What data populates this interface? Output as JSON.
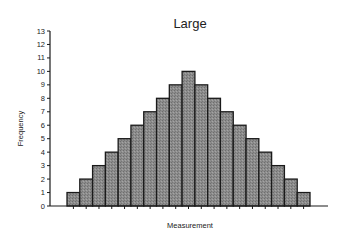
{
  "chart_data": {
    "type": "bar",
    "title": "Large",
    "xlabel": "Measurement",
    "ylabel": "Frequency",
    "ylim": [
      0,
      13
    ],
    "yticks": [
      0,
      1,
      2,
      3,
      4,
      5,
      6,
      7,
      8,
      9,
      10,
      11,
      12,
      13
    ],
    "categories": [
      "1",
      "2",
      "3",
      "4",
      "5",
      "6",
      "7",
      "8",
      "9",
      "10",
      "11",
      "12",
      "13",
      "14",
      "15",
      "16",
      "17",
      "18",
      "19"
    ],
    "values": [
      1,
      2,
      3,
      4,
      5,
      6,
      7,
      8,
      9,
      10,
      9,
      8,
      7,
      6,
      5,
      4,
      3,
      2,
      1
    ],
    "grid": false,
    "legend": null,
    "bar_fill": "#8a8a8a",
    "bar_stroke": "#1a1a1a",
    "axis_color": "#1a1a1a"
  }
}
